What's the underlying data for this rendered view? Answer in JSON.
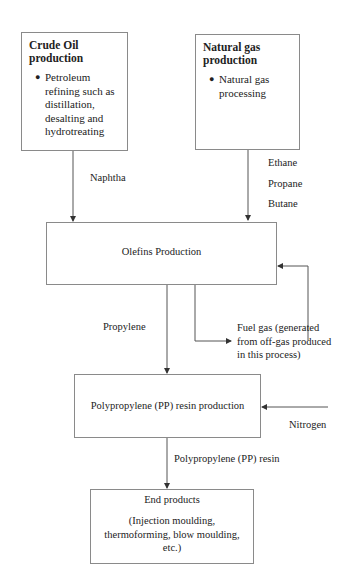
{
  "diagram": {
    "crude_oil": {
      "title_line1": "Crude Oil",
      "title_line2": "production",
      "bullet": "Petroleum refining such as distillation, desalting and hydrotreating"
    },
    "natural_gas": {
      "title_line1": "Natural gas",
      "title_line2": "production",
      "bullet": "Natural gas processing"
    },
    "flows": {
      "naphtha": "Naphtha",
      "ethane": "Ethane",
      "propane": "Propane",
      "butane": "Butane",
      "propylene": "Propylene",
      "fuel_gas_line1": "Fuel gas (generated",
      "fuel_gas_line2": "from off-gas produced",
      "fuel_gas_line3": "in this process)",
      "nitrogen": "Nitrogen",
      "pp_resin": "Polypropylene (PP) resin"
    },
    "olefins": {
      "label": "Olefins Production"
    },
    "pp_production": {
      "label": "Polypropylene (PP) resin production"
    },
    "end_products": {
      "title": "End products",
      "detail_line1": "(Injection moulding,",
      "detail_line2": "thermoforming, blow moulding,",
      "detail_line3": "etc.)"
    },
    "colors": {
      "line": "#555555",
      "box_border": "#8a8a8a",
      "text": "#222222"
    }
  }
}
